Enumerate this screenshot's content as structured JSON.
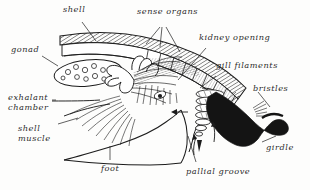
{
  "figure": {
    "background_color": "#fdfdfc",
    "ink_color": "#1c1c1c",
    "width": 310,
    "height": 190
  },
  "labels": {
    "shell": "shell",
    "sense_organs": "sense organs",
    "kidney_opening": "kidney opening",
    "gill_filaments": "gill filaments",
    "bristles": "bristles",
    "girdle": "girdle",
    "pallial_groove": "pallial groove",
    "foot": "foot",
    "shell_muscle_line1": "shell",
    "shell_muscle_line2": "muscle",
    "exhalant_line1": "exhalant",
    "exhalant_line2": "chamber",
    "gonad": "gonad"
  },
  "parts": [
    {
      "name": "shell",
      "label": "shell",
      "description": "hatched shell plate band arcing across the top"
    },
    {
      "name": "sense-organs",
      "label": "sense organs",
      "description": "segmented aesthete pores along the shell plates"
    },
    {
      "name": "kidney-opening",
      "label": "kidney opening",
      "description": "opening on the underside of the shell band"
    },
    {
      "name": "gill-filaments",
      "label": "gill filaments",
      "description": "ctenidial filaments in the pallial groove"
    },
    {
      "name": "bristles",
      "label": "bristles",
      "description": "spicules projecting from the girdle"
    },
    {
      "name": "girdle",
      "label": "girdle",
      "description": "thick black marginal girdle"
    },
    {
      "name": "pallial-groove",
      "label": "pallial groove",
      "description": "water channel between foot and girdle"
    },
    {
      "name": "foot",
      "label": "foot",
      "description": "broad muscular foot"
    },
    {
      "name": "shell-muscle",
      "label": "shell muscle",
      "description": "fanned muscle fibers attaching to the shell"
    },
    {
      "name": "exhalant-chamber",
      "label": "exhalant chamber",
      "description": "posterior chamber for exhalant water flow"
    },
    {
      "name": "gonad",
      "label": "gonad",
      "description": "oval gonad containing eggs"
    }
  ]
}
